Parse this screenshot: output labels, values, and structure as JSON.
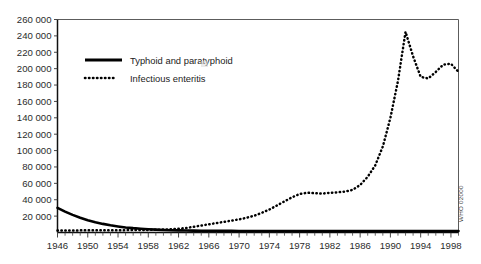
{
  "chart_data": {
    "type": "line",
    "title": "",
    "subtitle": "",
    "xlabel": "",
    "ylabel": "",
    "grid": false,
    "legend_position": "top-left-inside",
    "xlim": [
      1946,
      1999
    ],
    "ylim": [
      0,
      260000
    ],
    "y_ticks": [
      260000,
      240000,
      220000,
      200000,
      180000,
      160000,
      140000,
      120000,
      100000,
      80000,
      60000,
      40000,
      20000
    ],
    "y_tick_labels": [
      "260 000",
      "240 000",
      "220 000",
      "200 000",
      "180 000",
      "160 000",
      "140 000",
      "120 000",
      "100 000",
      "80 000",
      "60 000",
      "40 000",
      "20 000"
    ],
    "x_ticks": [
      1946,
      1950,
      1954,
      1958,
      1962,
      1966,
      1970,
      1974,
      1978,
      1982,
      1986,
      1990,
      1994,
      1998
    ],
    "x_tick_labels": [
      "1946",
      "1950",
      "1954",
      "1958",
      "1962",
      "1966",
      "1970",
      "1974",
      "1978",
      "1982",
      "1986",
      "1990",
      "1994",
      "1998"
    ],
    "x": [
      1946,
      1947,
      1948,
      1949,
      1950,
      1951,
      1952,
      1953,
      1954,
      1955,
      1956,
      1957,
      1958,
      1959,
      1960,
      1961,
      1962,
      1963,
      1964,
      1965,
      1966,
      1967,
      1968,
      1969,
      1970,
      1971,
      1972,
      1973,
      1974,
      1975,
      1976,
      1977,
      1978,
      1979,
      1980,
      1981,
      1982,
      1983,
      1984,
      1985,
      1986,
      1987,
      1988,
      1989,
      1990,
      1991,
      1992,
      1993,
      1994,
      1995,
      1996,
      1997,
      1998,
      1999
    ],
    "series": [
      {
        "name": "Typhoid and paratyphoid",
        "style": "solid",
        "color": "#000000",
        "values": [
          30000,
          25500,
          21500,
          18000,
          15000,
          12500,
          10500,
          8800,
          7400,
          6200,
          5300,
          4600,
          4000,
          3500,
          3100,
          2800,
          2600,
          2400,
          2300,
          2200,
          2100,
          2050,
          2000,
          1950,
          1900,
          1880,
          1850,
          1820,
          1800,
          1780,
          1760,
          1740,
          1720,
          1700,
          1700,
          1700,
          1700,
          1700,
          1700,
          1700,
          1700,
          1700,
          1700,
          1700,
          1700,
          1700,
          1700,
          1700,
          1700,
          1700,
          1700,
          1700,
          1700,
          1700
        ]
      },
      {
        "name": "Infectious enteritis",
        "style": "dotted",
        "color": "#000000",
        "values": [
          2500,
          2500,
          2500,
          2600,
          2600,
          2700,
          2700,
          2800,
          2800,
          2900,
          3000,
          3100,
          3200,
          3400,
          3600,
          4000,
          4500,
          5500,
          7000,
          8500,
          10000,
          11500,
          13000,
          14500,
          16000,
          18000,
          20500,
          24000,
          28000,
          33000,
          38000,
          43000,
          47000,
          48500,
          48000,
          47500,
          48500,
          49000,
          50000,
          52000,
          58000,
          68000,
          82000,
          105000,
          140000,
          185000,
          245000,
          215000,
          190000,
          188000,
          196000,
          205000,
          206000,
          196000
        ]
      }
    ],
    "annotations": [
      {
        "text": "WHO 02000",
        "position": "right-edge-vertical"
      }
    ]
  },
  "legend": {
    "entries": [
      {
        "label": "Typhoid and paratyphoid",
        "style": "solid"
      },
      {
        "label": "Infectious enteritis",
        "style": "dotted"
      }
    ]
  },
  "credit": {
    "text": "WHO 02000"
  }
}
